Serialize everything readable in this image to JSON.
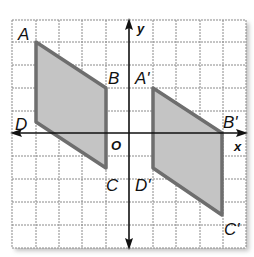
{
  "figure": {
    "grid": {
      "cols": 10,
      "rows": 10,
      "x0": 12,
      "y0": 20,
      "cell": 23.4
    },
    "axes": {
      "x_label": "x",
      "y_label": "y",
      "origin_label": "O"
    },
    "colors": {
      "fill": "#c4c4c4",
      "edge": "#6e6e6e",
      "grid": "#9a9a9a",
      "axis": "#111111"
    },
    "original": {
      "vertices": [
        {
          "name": "A",
          "px": [
            36,
            42
          ]
        },
        {
          "name": "B",
          "px": [
            106,
            88
          ]
        },
        {
          "name": "C",
          "px": [
            106,
            168
          ]
        },
        {
          "name": "D",
          "px": [
            36,
            122
          ]
        }
      ]
    },
    "image": {
      "vertices": [
        {
          "name": "A'",
          "px": [
            153,
            88
          ]
        },
        {
          "name": "B'",
          "px": [
            222,
            133
          ]
        },
        {
          "name": "C'",
          "px": [
            222,
            215
          ]
        },
        {
          "name": "D'",
          "px": [
            153,
            168
          ]
        }
      ]
    },
    "labels": {
      "A": "A",
      "B": "B",
      "C": "C",
      "D": "D",
      "Ap": "A'",
      "Bp": "B'",
      "Cp": "C'",
      "Dp": "D'"
    }
  }
}
